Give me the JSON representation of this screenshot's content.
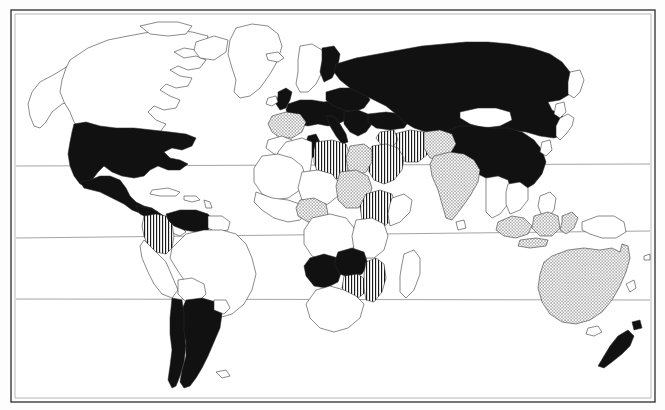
{
  "figure": {
    "kind": "world-map",
    "projection": "cylindrical-equidistant",
    "background_color": "#ffffff",
    "outline_color": "#2b2b2b",
    "frame_color": "#3a3a3a",
    "graticule_color": "#8d8d8d",
    "title": "",
    "caption": ""
  },
  "legend": {
    "visible": false,
    "entries": [
      {
        "key": "solid",
        "label": "",
        "fill": "#111111",
        "pattern": "solid-black"
      },
      {
        "key": "vert",
        "label": "",
        "fill": "#ffffff",
        "pattern": "vertical-hatch"
      },
      {
        "key": "dots",
        "label": "",
        "fill": "#ffffff",
        "pattern": "stipple-dots"
      },
      {
        "key": "none",
        "label": "",
        "fill": "#ffffff",
        "pattern": "plain-white"
      }
    ]
  },
  "graticule": {
    "lines": [
      {
        "name": "tropic-of-cancer",
        "y_left": 166,
        "y_right": 164
      },
      {
        "name": "equator",
        "y_left": 238,
        "y_right": 231
      },
      {
        "name": "tropic-of-capricorn",
        "y_left": 299,
        "y_right": 300
      }
    ]
  },
  "chart_data": {
    "type": "map",
    "title": "",
    "categories": [
      "solid",
      "vert",
      "dots",
      "none"
    ],
    "regions": [
      {
        "name": "United States",
        "category": "solid"
      },
      {
        "name": "Mexico",
        "category": "solid"
      },
      {
        "name": "Canada",
        "category": "none"
      },
      {
        "name": "Greenland",
        "category": "none"
      },
      {
        "name": "Alaska",
        "category": "none"
      },
      {
        "name": "Guatemala",
        "category": "solid"
      },
      {
        "name": "Honduras",
        "category": "solid"
      },
      {
        "name": "Nicaragua",
        "category": "none"
      },
      {
        "name": "Costa Rica",
        "category": "none"
      },
      {
        "name": "Panama",
        "category": "none"
      },
      {
        "name": "Cuba",
        "category": "none"
      },
      {
        "name": "Colombia",
        "category": "vert"
      },
      {
        "name": "Venezuela",
        "category": "solid"
      },
      {
        "name": "Guyana",
        "category": "none"
      },
      {
        "name": "Brazil",
        "category": "none"
      },
      {
        "name": "Peru",
        "category": "none"
      },
      {
        "name": "Bolivia",
        "category": "none"
      },
      {
        "name": "Paraguay",
        "category": "none"
      },
      {
        "name": "Uruguay",
        "category": "none"
      },
      {
        "name": "Argentina",
        "category": "solid"
      },
      {
        "name": "Chile",
        "category": "solid"
      },
      {
        "name": "United Kingdom",
        "category": "solid"
      },
      {
        "name": "Ireland",
        "category": "none"
      },
      {
        "name": "France",
        "category": "solid"
      },
      {
        "name": "Germany",
        "category": "solid"
      },
      {
        "name": "Poland",
        "category": "solid"
      },
      {
        "name": "Italy",
        "category": "solid"
      },
      {
        "name": "Spain",
        "category": "dots"
      },
      {
        "name": "Portugal",
        "category": "dots"
      },
      {
        "name": "Norway",
        "category": "none"
      },
      {
        "name": "Sweden",
        "category": "none"
      },
      {
        "name": "Finland",
        "category": "solid"
      },
      {
        "name": "Iceland",
        "category": "none"
      },
      {
        "name": "Greece",
        "category": "solid"
      },
      {
        "name": "Turkey",
        "category": "solid"
      },
      {
        "name": "Russia",
        "category": "solid"
      },
      {
        "name": "Kazakhstan",
        "category": "solid"
      },
      {
        "name": "Mongolia",
        "category": "none"
      },
      {
        "name": "China",
        "category": "solid"
      },
      {
        "name": "Japan",
        "category": "none"
      },
      {
        "name": "Korea",
        "category": "none"
      },
      {
        "name": "India",
        "category": "dots"
      },
      {
        "name": "Pakistan",
        "category": "dots"
      },
      {
        "name": "Iran",
        "category": "vert"
      },
      {
        "name": "Iraq",
        "category": "vert"
      },
      {
        "name": "Saudi Arabia",
        "category": "vert"
      },
      {
        "name": "Egypt",
        "category": "dots"
      },
      {
        "name": "Libya",
        "category": "vert"
      },
      {
        "name": "Tunisia",
        "category": "solid"
      },
      {
        "name": "Algeria",
        "category": "none"
      },
      {
        "name": "Morocco",
        "category": "none"
      },
      {
        "name": "Sudan",
        "category": "dots"
      },
      {
        "name": "Ethiopia",
        "category": "vert"
      },
      {
        "name": "Nigeria",
        "category": "dots"
      },
      {
        "name": "Kenya",
        "category": "none"
      },
      {
        "name": "Tanzania",
        "category": "none"
      },
      {
        "name": "Angola",
        "category": "solid"
      },
      {
        "name": "Zambia",
        "category": "solid"
      },
      {
        "name": "Zimbabwe",
        "category": "vert"
      },
      {
        "name": "Mozambique",
        "category": "vert"
      },
      {
        "name": "South Africa",
        "category": "none"
      },
      {
        "name": "Madagascar",
        "category": "none"
      },
      {
        "name": "Indonesia",
        "category": "dots"
      },
      {
        "name": "Malaysia",
        "category": "none"
      },
      {
        "name": "Philippines",
        "category": "none"
      },
      {
        "name": "Papua New Guinea",
        "category": "none"
      },
      {
        "name": "Australia",
        "category": "dots"
      },
      {
        "name": "New Zealand",
        "category": "solid"
      }
    ]
  }
}
